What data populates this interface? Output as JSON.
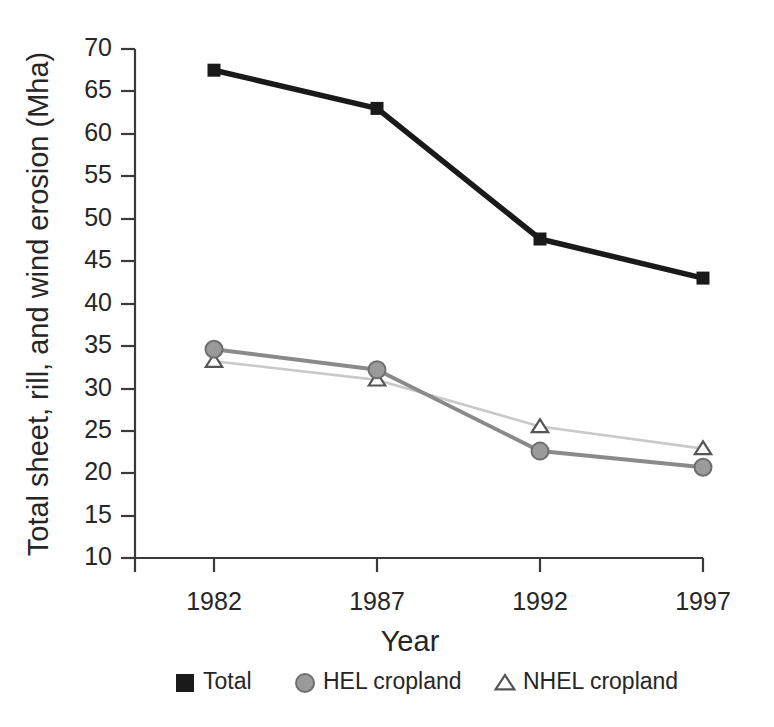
{
  "chart_data": {
    "type": "line",
    "title": "",
    "xlabel": "Year",
    "ylabel": "Total sheet, rill, and wind erosion (Mha)",
    "categories": [
      "1982",
      "1987",
      "1992",
      "1997"
    ],
    "x": [
      1982,
      1987,
      1992,
      1997
    ],
    "xlim": [
      1980.2,
      1997.8
    ],
    "ylim": [
      10,
      70
    ],
    "y_ticks": [
      10,
      15,
      20,
      25,
      30,
      35,
      40,
      45,
      50,
      55,
      60,
      65,
      70
    ],
    "y_tick_labels": [
      "10",
      "15",
      "20",
      "25",
      "30",
      "35",
      "40",
      "45",
      "50",
      "55",
      "60",
      "65",
      "70"
    ],
    "x_ticks": [
      1982,
      1987,
      1992,
      1997
    ],
    "x_tick_labels": [
      "1982",
      "1987",
      "1992",
      "1997"
    ],
    "grid": false,
    "legend_position": "bottom",
    "series": [
      {
        "name": "Total",
        "values": [
          67.5,
          63.0,
          47.6,
          43.0
        ],
        "color": "#1a1a1a",
        "marker": "square",
        "marker_fill": "#1a1a1a",
        "line_style": "solid"
      },
      {
        "name": "HEL cropland",
        "values": [
          34.6,
          32.2,
          22.6,
          20.7
        ],
        "color": "#8a8a8a",
        "marker": "circle",
        "marker_fill": "#9a9a9a",
        "line_style": "solid"
      },
      {
        "name": "NHEL cropland",
        "values": [
          33.2,
          31.0,
          25.5,
          22.9
        ],
        "color": "#c9c9c9",
        "marker": "triangle",
        "marker_fill": "#ffffff",
        "line_style": "solid"
      }
    ]
  },
  "axis": {
    "y_label": "Total sheet, rill, and wind erosion (Mha)",
    "x_label": "Year",
    "y_tick_70": "70",
    "y_tick_65": "65",
    "y_tick_60": "60",
    "y_tick_55": "55",
    "y_tick_50": "50",
    "y_tick_45": "45",
    "y_tick_40": "40",
    "y_tick_35": "35",
    "y_tick_30": "30",
    "y_tick_25": "25",
    "y_tick_20": "20",
    "y_tick_15": "15",
    "y_tick_10": "10",
    "x_tick_1982": "1982",
    "x_tick_1987": "1987",
    "x_tick_1992": "1992",
    "x_tick_1997": "1997"
  },
  "legend": {
    "items": [
      {
        "label": "Total",
        "marker": "square-filled-black"
      },
      {
        "label": "HEL cropland",
        "marker": "circle-filled-gray"
      },
      {
        "label": "NHEL cropland",
        "marker": "triangle-outline"
      }
    ]
  },
  "colors": {
    "total": "#1a1a1a",
    "hel": "#8a8a8a",
    "hel_marker": "#9a9a9a",
    "nhel": "#c9c9c9",
    "axis": "#3a3a3a",
    "text": "#262626",
    "background": "#ffffff"
  }
}
